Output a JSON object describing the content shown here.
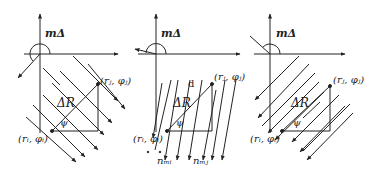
{
  "figure": {
    "panels": [
      {
        "id": "panel-1",
        "angle_label": "mΔ",
        "point_i_label": "(r_i, φ_i)",
        "point_i_text": "(rᵢ, φᵢ)",
        "point_j_label": "(r_j, φ_j)",
        "point_j_text": "(rⱼ, φⱼ)",
        "distance_label": "ΔR",
        "angle_psi_label": "ψ",
        "line_direction": "down-right (45°)"
      },
      {
        "id": "panel-2",
        "angle_label": "mΔ",
        "point_i_text": "(rᵢ, φᵢ)",
        "point_j_text": "(rⱼ, φⱼ)",
        "distance_label": "ΔR",
        "angle_psi_label": "ψ",
        "line_spacing_label": "d",
        "normal_i_label": "n_mi",
        "normal_i_text": "nₘᵢ",
        "normal_j_label": "n_mj",
        "normal_j_text": "nₘⱼ",
        "line_direction": "near-vertical downward"
      },
      {
        "id": "panel-3",
        "angle_label": "mΔ",
        "point_i_text": "(rᵢ, φᵢ)",
        "point_j_text": "(rⱼ, φⱼ)",
        "distance_label": "ΔR",
        "angle_psi_label": "ψ",
        "line_direction": "down-left (45°)"
      }
    ],
    "colors": {
      "ink": "#222222",
      "background": "#ffffff"
    }
  }
}
